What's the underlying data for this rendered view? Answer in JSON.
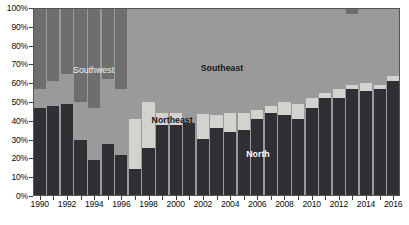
{
  "chart_data": {
    "type": "bar",
    "subtype": "stacked-percentage",
    "title": "",
    "xlabel": "",
    "ylabel": "",
    "ylim": [
      0,
      100
    ],
    "yunit": "%",
    "grid": false,
    "legend_position": "in-plot-annotations",
    "categories": [
      "1990",
      "1991",
      "1992",
      "1993",
      "1994",
      "1995",
      "1996",
      "1997",
      "1998",
      "1999",
      "2000",
      "2001",
      "2002",
      "2003",
      "2004",
      "2005",
      "2006",
      "2007",
      "2008",
      "2009",
      "2010",
      "2011",
      "2012",
      "2013",
      "2014",
      "2015",
      "2016"
    ],
    "x_tick_labels": [
      "1990",
      "1992",
      "1994",
      "1996",
      "1998",
      "2000",
      "2002",
      "2004",
      "2006",
      "2008",
      "2010",
      "2012",
      "2014",
      "2016"
    ],
    "y_tick_labels": [
      "0%",
      "10%",
      "20%",
      "30%",
      "40%",
      "50%",
      "60%",
      "70%",
      "80%",
      "90%",
      "100%"
    ],
    "y_tick_values": [
      0,
      10,
      20,
      30,
      40,
      50,
      60,
      70,
      80,
      90,
      100
    ],
    "series": [
      {
        "name": "North",
        "color": "#2f3033",
        "label_color": "#fdfdfd",
        "values": [
          47,
          48,
          49,
          30,
          19,
          27.5,
          22,
          14.5,
          25.5,
          38,
          38,
          39,
          30.5,
          36,
          34,
          35,
          41,
          44,
          43,
          41,
          47,
          52,
          52,
          57,
          56,
          57,
          61
        ]
      },
      {
        "name": "Northeast",
        "color": "#d2d2cf",
        "label_color": "#17171a",
        "values": [
          0,
          0,
          0,
          0,
          0,
          0,
          0,
          26.5,
          24.5,
          6,
          6,
          0,
          13,
          7,
          10,
          9,
          5,
          4,
          7,
          8,
          5,
          3,
          5,
          2,
          4,
          2,
          3
        ]
      },
      {
        "name": "Southeast",
        "color": "#9a9a9a",
        "label_color": "#17171a",
        "values": [
          10,
          13,
          16,
          20,
          28,
          35,
          35,
          59,
          50.5,
          56,
          56,
          61,
          56.5,
          57,
          56,
          56,
          54,
          52,
          50,
          51,
          48,
          45,
          43,
          38,
          40,
          41,
          36
        ]
      },
      {
        "name": "Southwest",
        "color": "#6e6e71",
        "label_color": "#f2f2f2",
        "values": [
          43,
          39,
          35,
          50,
          53,
          37.5,
          43,
          0,
          0,
          0,
          0,
          0,
          0,
          0,
          0,
          0,
          0,
          0,
          0,
          0,
          0,
          0,
          0,
          3,
          0,
          0,
          0
        ]
      }
    ],
    "annotations": [
      {
        "text": "Southwest",
        "x_pct": 16.5,
        "y_pct": 67.0,
        "style": "light"
      },
      {
        "text": "Southeast",
        "x_pct": 51.5,
        "y_pct": 68.0,
        "style": "dark"
      },
      {
        "text": "Northeast",
        "x_pct": 37.9,
        "y_pct": 40.5,
        "style": "dark"
      },
      {
        "text": "North",
        "x_pct": 61.3,
        "y_pct": 22.5,
        "style": "white"
      }
    ],
    "colors": {
      "north": "#2f3033",
      "northeast": "#d2d2cf",
      "southeast": "#9a9a9a",
      "southwest": "#6e6e71",
      "plot_background": "#9a9a9a",
      "page_background": "#ffffff",
      "axis": "#3a3a3a",
      "bar_separator": "#e9e9e9"
    }
  }
}
